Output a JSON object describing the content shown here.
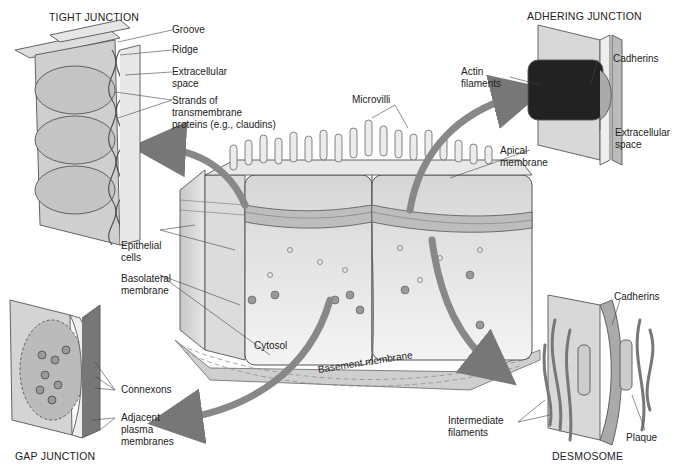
{
  "figure": {
    "panels": {
      "tight_junction": {
        "title": "TIGHT JUNCTION",
        "labels": [
          "Groove",
          "Ridge",
          "Extracellular\nspace",
          "Strands of\ntransmembrane\nproteins (e.g., claudins)"
        ]
      },
      "adhering_junction": {
        "title": "ADHERING JUNCTION",
        "labels": [
          "Cadherins",
          "Actin\nfilaments",
          "Extracellular\nspace"
        ]
      },
      "gap_junction": {
        "title": "GAP JUNCTION",
        "labels": [
          "Connexons",
          "Adjacent\nplasma\nmembranes"
        ]
      },
      "desmosome": {
        "title": "DESMOSOME",
        "labels": [
          "Cadherins",
          "Intermediate\nfilaments",
          "Plaque"
        ]
      }
    },
    "center": {
      "labels": [
        "Microvilli",
        "Apical\nmembrane",
        "Epithelial\ncells",
        "Basolateral\nmembrane",
        "Cytosol",
        "Basement membrane"
      ]
    }
  }
}
